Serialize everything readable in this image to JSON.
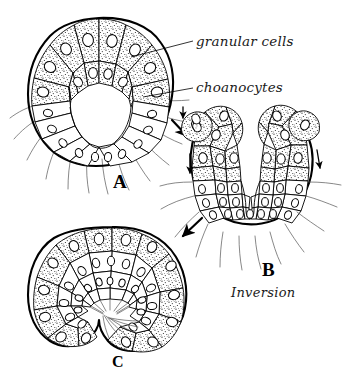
{
  "figure": {
    "background_color": "#ffffff",
    "ink_color": "#000000",
    "stipple_color": "#2a2a2a",
    "labels": [
      {
        "id": "granular-cells",
        "text": "granular cells",
        "x": 196,
        "y": 46
      },
      {
        "id": "choanocytes",
        "text": "choanocytes",
        "x": 196,
        "y": 92
      }
    ],
    "panels": [
      {
        "id": "A",
        "letter": "A",
        "x": 113,
        "y": 188
      },
      {
        "id": "B",
        "letter": "B",
        "x": 262,
        "y": 276
      },
      {
        "id": "C",
        "letter": "C",
        "x": 112,
        "y": 367
      }
    ],
    "caption": {
      "text": "Inversion",
      "x": 231,
      "y": 297
    },
    "arrows": [
      {
        "id": "arrow-a-to-b",
        "direction": "down-right"
      },
      {
        "id": "arrow-b-left-cell",
        "direction": "down"
      },
      {
        "id": "arrow-b-right-cell",
        "direction": "down"
      },
      {
        "id": "arrow-b-to-c",
        "direction": "down-left"
      }
    ],
    "cell_types": [
      {
        "id": "granular",
        "name": "granular cells",
        "appearance": "stippled",
        "fill": "stipple"
      },
      {
        "id": "choanocyte",
        "name": "choanocytes",
        "appearance": "clear with flagella",
        "fill": "#ffffff"
      }
    ]
  }
}
